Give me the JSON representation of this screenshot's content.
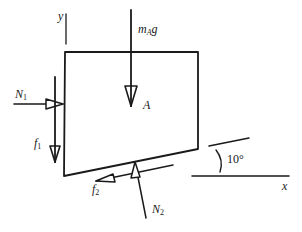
{
  "figure": {
    "type": "free-body-diagram",
    "body_label": "A",
    "axes": {
      "x_label": "x",
      "y_label": "y"
    },
    "angle_label": "10°",
    "forces": [
      {
        "id": "weight",
        "symbol": "m",
        "subscript": "A",
        "suffix": "g",
        "direction": "down"
      },
      {
        "id": "N1",
        "symbol": "N",
        "subscript": "1",
        "direction": "right"
      },
      {
        "id": "f1",
        "symbol": "f",
        "subscript": "1",
        "direction": "down"
      },
      {
        "id": "f2",
        "symbol": "f",
        "subscript": "2",
        "direction": "down-left along incline"
      },
      {
        "id": "N2",
        "symbol": "N",
        "subscript": "2",
        "direction": "up, normal to incline"
      }
    ],
    "colors": {
      "stroke": "#1a1a1a",
      "background": "#ffffff"
    }
  }
}
